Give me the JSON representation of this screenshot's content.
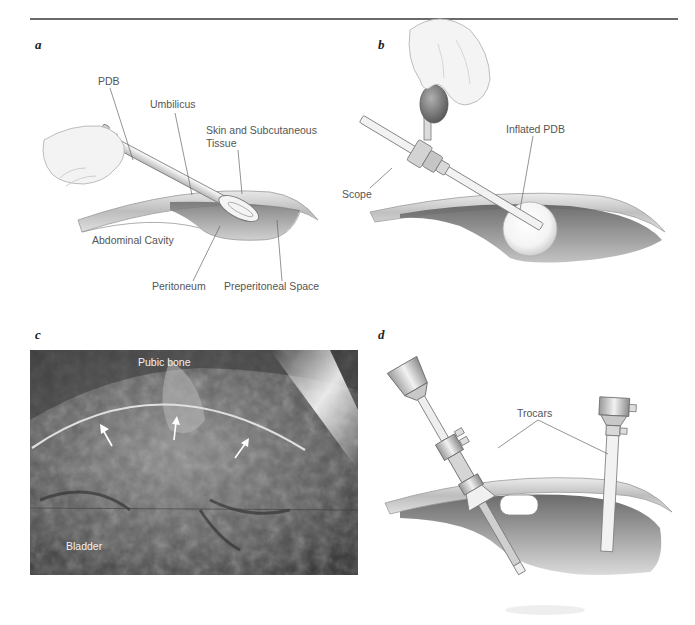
{
  "figure": {
    "header_rule": true,
    "panels": [
      {
        "id": "a",
        "letter": "a",
        "type": "illustration",
        "labels": {
          "pdb": "PDB",
          "umbilicus": "Umbilicus",
          "skin_line1": "Skin and Subcutaneous",
          "skin_line2": "Tissue",
          "abdominal_cavity": "Abdominal Cavity",
          "peritoneum": "Peritoneum",
          "preperitoneal_space": "Preperitoneal Space"
        }
      },
      {
        "id": "b",
        "letter": "b",
        "type": "illustration",
        "labels": {
          "scope": "Scope",
          "inflated_pdb": "Inflated PDB"
        }
      },
      {
        "id": "c",
        "letter": "c",
        "type": "photograph",
        "labels": {
          "pubic_bone": "Pubic bone",
          "bladder": "Bladder"
        },
        "arrow_count": 3
      },
      {
        "id": "d",
        "letter": "d",
        "type": "illustration",
        "labels": {
          "trocars": "Trocars"
        }
      }
    ]
  }
}
